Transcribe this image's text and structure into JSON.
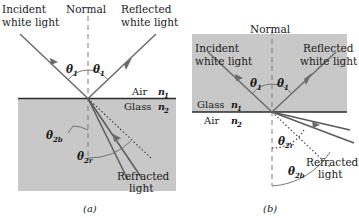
{
  "figure": {
    "background_color": "#ffffff",
    "slab_color": "#c8c8c8",
    "ray_color": "#6b6b6b",
    "line_color": "#2b2b2b"
  },
  "panels": [
    {
      "id": "a",
      "panel_label": "(a)",
      "description": "Light travelling in air strikes glass; refracted rays bend toward the normal",
      "labels": {
        "normal": "Normal",
        "incident": "Incident",
        "incident_second_line": "white light",
        "reflected": "Reflected",
        "reflected_second_line": "white light",
        "refracted": "Refracted",
        "refracted_second_line": "light",
        "upper_medium": "Air",
        "upper_index": "n",
        "upper_index_sub": "1",
        "lower_medium": "Glass",
        "lower_index": "n",
        "lower_index_sub": "2",
        "theta_incident": "θ",
        "theta_incident_sub": "1",
        "theta_reflected": "θ",
        "theta_reflected_sub": "1",
        "theta_blue": "θ",
        "theta_blue_sub": "2b",
        "theta_red": "θ",
        "theta_red_sub": "2r"
      }
    },
    {
      "id": "b",
      "panel_label": "(b)",
      "description": "Light travelling in glass strikes air; refracted rays bend away from the normal",
      "labels": {
        "normal": "Normal",
        "incident": "Incident",
        "incident_second_line": "white light",
        "reflected": "Reflected",
        "reflected_second_line": "white light",
        "refracted": "Refracted",
        "refracted_second_line": "light",
        "upper_medium": "Glass",
        "upper_index": "n",
        "upper_index_sub": "1",
        "lower_medium": "Air",
        "lower_index": "n",
        "lower_index_sub": "2",
        "theta_incident": "θ",
        "theta_incident_sub": "1",
        "theta_reflected": "θ",
        "theta_reflected_sub": "1",
        "theta_red": "θ",
        "theta_red_sub": "2r",
        "theta_blue": "θ",
        "theta_blue_sub": "2b"
      }
    }
  ]
}
